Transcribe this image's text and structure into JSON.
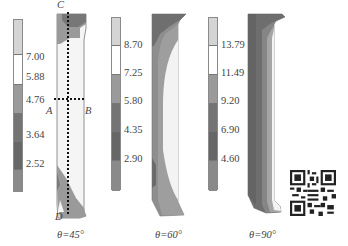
{
  "figure": {
    "panels": [
      {
        "caption": "θ=45°",
        "colorbar": {
          "ticks": [
            "7.00",
            "5.88",
            "4.76",
            "3.64",
            "2.52"
          ],
          "bands": [
            "#d4d4d4",
            "#ffffff",
            "#9a9a9a",
            "#747474",
            "#676767",
            "#8a8a8a"
          ]
        },
        "points": {
          "C": "C",
          "D": "D",
          "A": "A",
          "B": "B"
        }
      },
      {
        "caption": "θ=60°",
        "colorbar": {
          "ticks": [
            "8.70",
            "7.25",
            "5.80",
            "4.35",
            "2.90"
          ],
          "bands": [
            "#d4d4d4",
            "#ffffff",
            "#9a9a9a",
            "#747474",
            "#676767",
            "#8a8a8a"
          ]
        }
      },
      {
        "caption": "θ=90°",
        "colorbar": {
          "ticks": [
            "13.79",
            "11.49",
            "9.20",
            "6.90",
            "4.60"
          ],
          "bands": [
            "#d4d4d4",
            "#ffffff",
            "#9a9a9a",
            "#747474",
            "#676767",
            "#8a8a8a"
          ]
        }
      }
    ],
    "qr_code": "qr-code"
  }
}
